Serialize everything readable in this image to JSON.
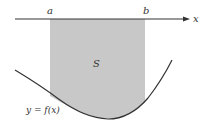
{
  "diagram": {
    "axis_label": "x",
    "point_a": "a",
    "point_b": "b",
    "region_label": "S",
    "curve_label": "y = f(x)",
    "colors": {
      "region_fill": "#c8c8c8",
      "line": "#333333"
    }
  }
}
